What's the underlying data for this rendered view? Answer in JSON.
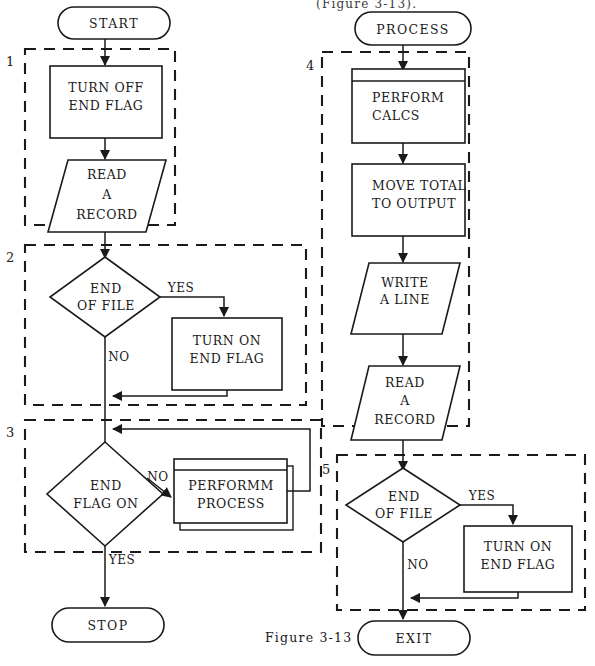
{
  "figure": {
    "top_note": "(Figure 3-13).",
    "caption": "Figure 3-13"
  },
  "groups": [
    {
      "id": "1",
      "label": "1"
    },
    {
      "id": "2",
      "label": "2"
    },
    {
      "id": "3",
      "label": "3"
    },
    {
      "id": "4",
      "label": "4"
    },
    {
      "id": "5",
      "label": "5"
    }
  ],
  "left_column": {
    "terminals": {
      "start": "START",
      "stop": "STOP"
    },
    "nodes": {
      "turn_off_end_flag": {
        "line1": "TURN  OFF",
        "line2": "END  FLAG"
      },
      "read_a_record": {
        "line1": "READ",
        "line2": "A",
        "line3": "RECORD"
      },
      "end_of_file": {
        "line1": "END",
        "line2": "OF  FILE"
      },
      "turn_on_end_flag": {
        "line1": "TURN  ON",
        "line2": "END  FLAG"
      },
      "end_flag_on": {
        "line1": "END",
        "line2": "FLAG  ON"
      },
      "performm_process": {
        "line1": "PERFORMM",
        "line2": "PROCESS"
      }
    },
    "branches": {
      "eof_yes": "YES",
      "eof_no": "NO",
      "flag_no": "NO",
      "flag_yes": "YES"
    }
  },
  "right_column": {
    "terminals": {
      "process": "PROCESS",
      "exit": "EXIT"
    },
    "nodes": {
      "perform_calcs": {
        "line1": "PERFORM",
        "line2": "CALCS"
      },
      "move_total": {
        "line1": "MOVE  TOTAL",
        "line2": "TO  OUTPUT"
      },
      "write_a_line": {
        "line1": "WRITE",
        "line2": "A  LINE"
      },
      "read_a_record": {
        "line1": "READ",
        "line2": "A",
        "line3": "RECORD"
      },
      "end_of_file": {
        "line1": "END",
        "line2": "OF  FILE"
      },
      "turn_on_end_flag": {
        "line1": "TURN  ON",
        "line2": "END  FLAG"
      }
    },
    "branches": {
      "eof_yes": "YES",
      "eof_no": "NO"
    }
  },
  "colors": {
    "ink": "#1a1a1a",
    "paper": "#ffffff"
  }
}
